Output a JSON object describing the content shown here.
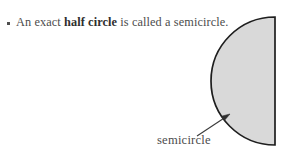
{
  "page": {
    "background_color": "#ffffff",
    "width": 289,
    "height": 159
  },
  "definition": {
    "bullet_glyph": "square-bullet",
    "text_before": "An exact ",
    "term": "half circle",
    "text_after": " is called a semicircle.",
    "full_text": "An exact half circle is called a semicircle.",
    "text_color": "#4c4c4c"
  },
  "figure": {
    "shape_name": "semicircle",
    "fill_color": "#d9d9d9",
    "stroke_color": "#1e1e1e",
    "flat_edge_side": "right",
    "bulge_direction": "left",
    "center_x": 275,
    "center_y": 81,
    "radius": 64
  },
  "callout": {
    "label": "semicircle",
    "label_color": "#4c4c4c",
    "arrow_color": "#3a3a3a",
    "arrow_tail_x": 197,
    "arrow_tail_y": 136,
    "arrow_tip_x": 229,
    "arrow_tip_y": 115
  }
}
